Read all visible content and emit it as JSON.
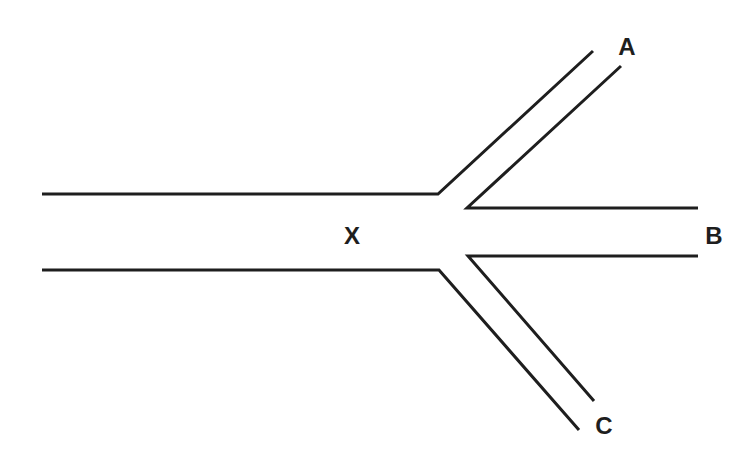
{
  "diagram": {
    "type": "branching-channel",
    "stroke_color": "#1e1e1e",
    "background": "#ffffff",
    "labels": {
      "main": "X",
      "branch_upper": "A",
      "branch_straight": "B",
      "branch_lower": "C"
    }
  }
}
